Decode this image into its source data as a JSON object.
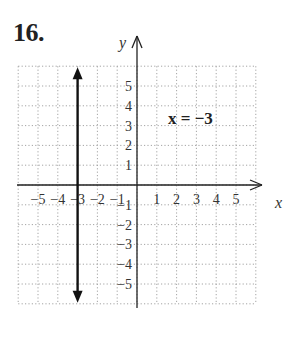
{
  "problem": {
    "number": "16."
  },
  "chart_data": {
    "type": "line",
    "title": "",
    "equation_label": "x = −3",
    "xlabel": "x",
    "ylabel": "y",
    "xlim": [
      -6,
      6
    ],
    "ylim": [
      -6,
      6
    ],
    "grid": true,
    "x_tick_labels": [
      "−5",
      "−4",
      "−3",
      "−2",
      "−1",
      "1",
      "2",
      "3",
      "4",
      "5"
    ],
    "y_tick_labels": [
      "5",
      "4",
      "3",
      "2",
      "1",
      "−1",
      "−2",
      "−3",
      "−4",
      "−5"
    ],
    "x_ticks": [
      -5,
      -4,
      -3,
      -2,
      -1,
      1,
      2,
      3,
      4,
      5
    ],
    "y_ticks": [
      5,
      4,
      3,
      2,
      1,
      -1,
      -2,
      -3,
      -4,
      -5
    ],
    "series": [
      {
        "name": "x = −3",
        "kind": "vertical-line",
        "x": [
          -3,
          -3
        ],
        "y": [
          -6,
          6
        ],
        "arrows": "both",
        "color": "#111111"
      }
    ]
  },
  "colors": {
    "grid": "#9a9a9a",
    "axis": "#222222",
    "line": "#111111"
  }
}
